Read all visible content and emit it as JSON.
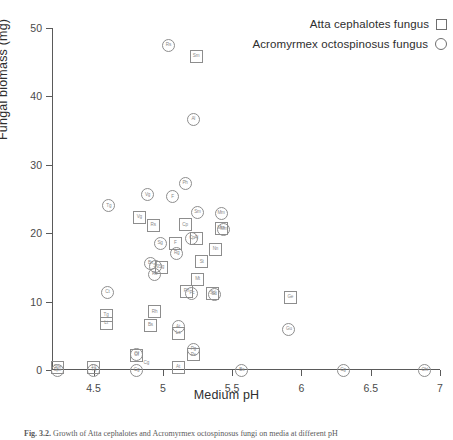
{
  "figure": {
    "xlabel": "Medium pH",
    "ylabel": "Fungal biomass (mg)",
    "caption_prefix": "Fig. 3.2.",
    "caption_text": "Growth of Atta cephalotes and Acromyrmex octospinosus fungi on media at different pH"
  },
  "legend": {
    "items": [
      {
        "label": "Atta cephalotes fungus",
        "key": "square-marker-icon"
      },
      {
        "label": "Acromyrmex octospinosus fungus",
        "key": "circle-marker-icon"
      }
    ]
  },
  "chart_data": {
    "type": "scatter",
    "title": "",
    "xlabel": "Medium pH",
    "ylabel": "Fungal biomass (mg)",
    "xlim": [
      4.2,
      7.0
    ],
    "ylim": [
      0,
      50
    ],
    "xticks": [
      4.5,
      5.0,
      5.5,
      6.0,
      6.5,
      7.0
    ],
    "xtick_labels": [
      "4.5",
      "5",
      "5.5",
      "6",
      "6.5",
      "7"
    ],
    "yticks": [
      0,
      10,
      20,
      30,
      40,
      50
    ],
    "ytick_labels": [
      "0",
      "10",
      "20",
      "30",
      "40",
      "50"
    ],
    "grid": false,
    "legend_position": "top-right",
    "series": [
      {
        "name": "Atta cephalotes fungus",
        "marker": "square",
        "points": [
          {
            "label": "Sm",
            "x": 5.24,
            "y": 45.9
          },
          {
            "label": "Vg",
            "x": 4.83,
            "y": 22.3
          },
          {
            "label": "Rs",
            "x": 4.93,
            "y": 21.1
          },
          {
            "label": "Cp",
            "x": 5.16,
            "y": 21.2
          },
          {
            "label": "Al",
            "x": 5.24,
            "y": 19.2
          },
          {
            "label": "F",
            "x": 5.09,
            "y": 18.5
          },
          {
            "label": "Sg",
            "x": 4.99,
            "y": 15.0
          },
          {
            "label": "Mm",
            "x": 5.42,
            "y": 20.7
          },
          {
            "label": "Nn",
            "x": 5.38,
            "y": 17.6
          },
          {
            "label": "St",
            "x": 5.28,
            "y": 15.8
          },
          {
            "label": "Mt",
            "x": 5.25,
            "y": 13.3
          },
          {
            "label": "Ph",
            "x": 5.17,
            "y": 11.5
          },
          {
            "label": "Sd",
            "x": 5.36,
            "y": 11.2
          },
          {
            "label": "Ge",
            "x": 5.92,
            "y": 10.6
          },
          {
            "label": "Rh",
            "x": 4.94,
            "y": 8.5
          },
          {
            "label": "Tg",
            "x": 4.59,
            "y": 8.0
          },
          {
            "label": "Lt",
            "x": 4.59,
            "y": 6.8
          },
          {
            "label": "Bs",
            "x": 4.91,
            "y": 6.5
          },
          {
            "label": "Ls",
            "x": 5.11,
            "y": 5.3
          },
          {
            "label": "Pe",
            "x": 5.22,
            "y": 2.2
          },
          {
            "label": "Of",
            "x": 4.81,
            "y": 2.1
          },
          {
            "label": "Spe",
            "x": 4.24,
            "y": 0.4
          },
          {
            "label": "Tq",
            "x": 4.5,
            "y": 0.4
          },
          {
            "label": "At",
            "x": 5.11,
            "y": 0.4
          }
        ]
      },
      {
        "name": "Acromyrmex octospinosus fungus",
        "marker": "circle",
        "points": [
          {
            "label": "Rs",
            "x": 5.04,
            "y": 47.5
          },
          {
            "label": "Al",
            "x": 5.22,
            "y": 36.6
          },
          {
            "label": "Ph",
            "x": 5.16,
            "y": 27.3
          },
          {
            "label": "Vg",
            "x": 4.89,
            "y": 25.6
          },
          {
            "label": "F",
            "x": 5.07,
            "y": 25.3
          },
          {
            "label": "Tg",
            "x": 4.61,
            "y": 24.0
          },
          {
            "label": "Sm",
            "x": 5.25,
            "y": 23.0
          },
          {
            "label": "Mm",
            "x": 5.42,
            "y": 22.9
          },
          {
            "label": "Mm",
            "x": 5.44,
            "y": 20.5
          },
          {
            "label": "Cp",
            "x": 5.21,
            "y": 19.2
          },
          {
            "label": "Sg",
            "x": 4.98,
            "y": 18.5
          },
          {
            "label": "Rg",
            "x": 5.1,
            "y": 17.1
          },
          {
            "label": "Bs",
            "x": 4.91,
            "y": 15.6
          },
          {
            "label": "Sg",
            "x": 4.95,
            "y": 15.2
          },
          {
            "label": "Rs",
            "x": 4.94,
            "y": 14.0
          },
          {
            "label": "Ct",
            "x": 4.6,
            "y": 11.3
          },
          {
            "label": "Pc",
            "x": 5.21,
            "y": 11.2
          },
          {
            "label": "Sd",
            "x": 5.37,
            "y": 11.1
          },
          {
            "label": "At",
            "x": 5.11,
            "y": 6.3
          },
          {
            "label": "Gu",
            "x": 5.91,
            "y": 5.9
          },
          {
            "label": "Pg",
            "x": 5.22,
            "y": 3.0
          },
          {
            "label": "Of",
            "x": 4.81,
            "y": 2.3
          },
          {
            "label": "Spe",
            "x": 4.24,
            "y": 0.0
          },
          {
            "label": "Tq",
            "x": 4.5,
            "y": 0.0
          },
          {
            "label": "Cg",
            "x": 4.81,
            "y": 0.0
          },
          {
            "label": "Bs",
            "x": 5.57,
            "y": 0.0
          },
          {
            "label": "Cg",
            "x": 6.3,
            "y": 0.0
          },
          {
            "label": "Ohl",
            "x": 6.89,
            "y": 0.0
          }
        ]
      }
    ],
    "unattached_labels": [
      {
        "label": "Cg",
        "x": 4.86,
        "y": 0.9
      }
    ]
  }
}
